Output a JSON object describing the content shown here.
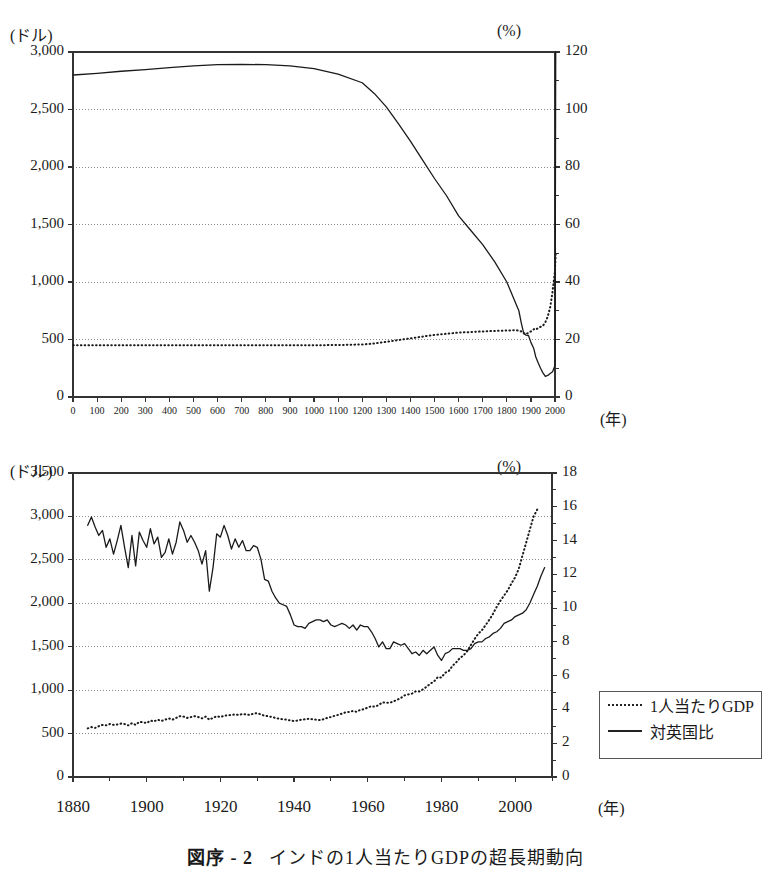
{
  "caption": {
    "number": "図序 - 2",
    "text": "インドの1人当たりGDPの超長期動向"
  },
  "legend": {
    "items": [
      {
        "label": "1人当たりGDP",
        "style": "dotted"
      },
      {
        "label": "対英国比",
        "style": "solid"
      }
    ]
  },
  "chart_data": [
    {
      "id": "top",
      "type": "line",
      "title": "",
      "xlabel": "(年)",
      "ylabel_left": "(ドル)",
      "ylabel_right": "(%)",
      "grid": true,
      "legend_position": "none",
      "xlim": [
        0,
        2000
      ],
      "xticks": [
        0,
        100,
        200,
        300,
        400,
        500,
        600,
        700,
        800,
        900,
        1000,
        1100,
        1200,
        1300,
        1400,
        1500,
        1600,
        1700,
        1800,
        1900,
        2000
      ],
      "xtick_labels": [
        "0",
        "100",
        "200",
        "300",
        "400",
        "500",
        "600",
        "700",
        "800",
        "900",
        "1000",
        "1100",
        "1200",
        "1300",
        "1400",
        "1500",
        "1600",
        "1700",
        "1800",
        "1900",
        "2000"
      ],
      "ylim_left": [
        0,
        3000
      ],
      "yticks_left": [
        0,
        500,
        1000,
        1500,
        2000,
        2500,
        3000
      ],
      "ytick_labels_left": [
        "0",
        "500",
        "1,000",
        "1,500",
        "2,000",
        "2,500",
        "3,000"
      ],
      "ylim_right": [
        0,
        120
      ],
      "yticks_right": [
        0,
        20,
        40,
        60,
        80,
        100,
        120
      ],
      "ytick_labels_right": [
        "0",
        "20",
        "40",
        "60",
        "80",
        "100",
        "120"
      ],
      "series": [
        {
          "name": "対英国比",
          "axis": "right",
          "style": "solid",
          "x": [
            1,
            100,
            200,
            300,
            400,
            500,
            600,
            700,
            800,
            900,
            1000,
            1100,
            1200,
            1250,
            1300,
            1350,
            1400,
            1450,
            1500,
            1550,
            1600,
            1650,
            1700,
            1750,
            1800,
            1820,
            1840,
            1850,
            1860,
            1870,
            1880,
            1890,
            1900,
            1910,
            1913,
            1920,
            1930,
            1940,
            1950,
            1960,
            1970,
            1980,
            1990,
            2000,
            2003
          ],
          "values": [
            112.0,
            112.6,
            113.3,
            113.9,
            114.6,
            115.2,
            115.6,
            115.7,
            115.6,
            115.2,
            114.2,
            112.3,
            109.3,
            105.6,
            100.9,
            95.1,
            89.0,
            82.5,
            76.0,
            70.0,
            63.0,
            58.0,
            53.0,
            47.0,
            40.0,
            36.0,
            32.0,
            30.0,
            25.8,
            22.2,
            21.5,
            21.4,
            19.0,
            17.2,
            16.5,
            14.0,
            11.9,
            10.0,
            8.4,
            7.2,
            7.5,
            8.2,
            8.8,
            11.0,
            120.0
          ]
        },
        {
          "name": "1人当たりGDP",
          "axis": "left",
          "style": "dotted",
          "x": [
            1,
            100,
            200,
            300,
            400,
            500,
            600,
            700,
            800,
            900,
            1000,
            1100,
            1200,
            1250,
            1300,
            1350,
            1400,
            1450,
            1500,
            1550,
            1600,
            1650,
            1700,
            1750,
            1800,
            1820,
            1840,
            1850,
            1860,
            1870,
            1880,
            1890,
            1900,
            1913,
            1920,
            1930,
            1940,
            1950,
            1960,
            1970,
            1980,
            1990,
            2000,
            2003
          ],
          "values": [
            450,
            450,
            450,
            450,
            450,
            450,
            450,
            450,
            450,
            450,
            450,
            452,
            457,
            465,
            480,
            495,
            510,
            525,
            540,
            550,
            560,
            565,
            570,
            575,
            578,
            580,
            580,
            578,
            570,
            555,
            545,
            560,
            570,
            590,
            585,
            600,
            610,
            620,
            650,
            700,
            780,
            920,
            1100,
            1250
          ]
        }
      ]
    },
    {
      "id": "bottom",
      "type": "line",
      "title": "",
      "xlabel": "(年)",
      "ylabel_left": "(ドル)",
      "ylabel_right": "(%)",
      "grid": true,
      "legend_position": "right",
      "xlim": [
        1880,
        2010
      ],
      "xticks": [
        1880,
        1900,
        1920,
        1940,
        1960,
        1980,
        2000
      ],
      "xtick_labels": [
        "1880",
        "1900",
        "1920",
        "1940",
        "1960",
        "1980",
        "2000"
      ],
      "ylim_left": [
        0,
        3500
      ],
      "yticks_left": [
        0,
        500,
        1000,
        1500,
        2000,
        2500,
        3000,
        3500
      ],
      "ytick_labels_left": [
        "0",
        "500",
        "1,000",
        "1,500",
        "2,000",
        "2,500",
        "3,000",
        "3,500"
      ],
      "ylim_right": [
        0,
        18
      ],
      "yticks_right": [
        0,
        2,
        4,
        6,
        8,
        10,
        12,
        14,
        16,
        18
      ],
      "ytick_labels_right": [
        "0",
        "2",
        "4",
        "6",
        "8",
        "10",
        "12",
        "14",
        "16",
        "18"
      ],
      "series": [
        {
          "name": "対英国比",
          "axis": "right",
          "style": "solid",
          "x": [
            1884,
            1885,
            1886,
            1887,
            1888,
            1889,
            1890,
            1891,
            1892,
            1893,
            1894,
            1895,
            1896,
            1897,
            1898,
            1899,
            1900,
            1901,
            1902,
            1903,
            1904,
            1905,
            1906,
            1907,
            1908,
            1909,
            1910,
            1911,
            1912,
            1913,
            1914,
            1915,
            1916,
            1917,
            1918,
            1919,
            1920,
            1921,
            1922,
            1923,
            1924,
            1925,
            1926,
            1927,
            1928,
            1929,
            1930,
            1931,
            1932,
            1933,
            1934,
            1935,
            1936,
            1937,
            1938,
            1939,
            1940,
            1941,
            1942,
            1943,
            1944,
            1945,
            1946,
            1947,
            1948,
            1949,
            1950,
            1951,
            1952,
            1953,
            1954,
            1955,
            1956,
            1957,
            1958,
            1959,
            1960,
            1961,
            1962,
            1963,
            1964,
            1965,
            1966,
            1967,
            1968,
            1969,
            1970,
            1971,
            1972,
            1973,
            1974,
            1975,
            1976,
            1977,
            1978,
            1979,
            1980,
            1981,
            1982,
            1983,
            1984,
            1985,
            1986,
            1987,
            1988,
            1989,
            1990,
            1991,
            1992,
            1993,
            1994,
            1995,
            1996,
            1997,
            1998,
            1999,
            2000,
            2001,
            2002,
            2003,
            2004,
            2005,
            2006,
            2007,
            2008
          ],
          "values": [
            14.9,
            15.4,
            14.8,
            14.3,
            14.6,
            13.6,
            14.1,
            13.2,
            14.0,
            14.9,
            13.6,
            12.4,
            14.3,
            12.5,
            14.5,
            14.0,
            13.6,
            14.7,
            13.8,
            14.2,
            13.0,
            13.3,
            14.1,
            13.2,
            13.9,
            15.1,
            14.6,
            13.9,
            14.3,
            13.9,
            13.4,
            12.6,
            13.4,
            11.0,
            12.4,
            14.4,
            14.2,
            14.9,
            14.3,
            13.5,
            14.1,
            13.6,
            14.0,
            13.4,
            13.4,
            13.7,
            13.6,
            12.9,
            11.7,
            11.6,
            11.0,
            10.6,
            10.3,
            10.2,
            10.1,
            9.6,
            9.0,
            8.9,
            8.9,
            8.8,
            9.1,
            9.2,
            9.3,
            9.3,
            9.2,
            9.3,
            9.0,
            8.9,
            9.0,
            9.1,
            9.0,
            8.8,
            9.0,
            8.7,
            9.0,
            8.9,
            8.9,
            8.6,
            8.2,
            7.7,
            8.0,
            7.6,
            7.6,
            8.0,
            7.9,
            7.8,
            7.9,
            7.6,
            7.3,
            7.4,
            7.2,
            7.5,
            7.3,
            7.5,
            7.7,
            7.2,
            6.9,
            7.3,
            7.4,
            7.6,
            7.6,
            7.6,
            7.5,
            7.5,
            7.6,
            7.9,
            8.0,
            8.0,
            8.2,
            8.3,
            8.5,
            8.6,
            8.8,
            9.1,
            9.2,
            9.3,
            9.5,
            9.6,
            9.7,
            9.9,
            10.3,
            10.8,
            11.3,
            11.9,
            12.4
          ]
        },
        {
          "name": "1人当たりGDP",
          "axis": "left",
          "style": "dotted",
          "x": [
            1884,
            1885,
            1886,
            1887,
            1888,
            1889,
            1890,
            1891,
            1892,
            1893,
            1894,
            1895,
            1896,
            1897,
            1898,
            1899,
            1900,
            1901,
            1902,
            1903,
            1904,
            1905,
            1906,
            1907,
            1908,
            1909,
            1910,
            1911,
            1912,
            1913,
            1914,
            1915,
            1916,
            1917,
            1918,
            1919,
            1920,
            1921,
            1922,
            1923,
            1924,
            1925,
            1926,
            1927,
            1928,
            1929,
            1930,
            1931,
            1932,
            1933,
            1934,
            1935,
            1936,
            1937,
            1938,
            1939,
            1940,
            1941,
            1942,
            1943,
            1944,
            1945,
            1946,
            1947,
            1948,
            1949,
            1950,
            1951,
            1952,
            1953,
            1954,
            1955,
            1956,
            1957,
            1958,
            1959,
            1960,
            1961,
            1962,
            1963,
            1964,
            1965,
            1966,
            1967,
            1968,
            1969,
            1970,
            1971,
            1972,
            1973,
            1974,
            1975,
            1976,
            1977,
            1978,
            1979,
            1980,
            1981,
            1982,
            1983,
            1984,
            1985,
            1986,
            1987,
            1988,
            1989,
            1990,
            1991,
            1992,
            1993,
            1994,
            1995,
            1996,
            1997,
            1998,
            1999,
            2000,
            2001,
            2002,
            2003,
            2004,
            2005,
            2006,
            2007,
            2008
          ],
          "values": [
            560,
            575,
            565,
            585,
            600,
            595,
            610,
            600,
            605,
            615,
            610,
            595,
            620,
            600,
            635,
            630,
            620,
            650,
            640,
            660,
            645,
            660,
            675,
            660,
            680,
            700,
            695,
            680,
            690,
            700,
            690,
            675,
            695,
            660,
            680,
            700,
            690,
            705,
            710,
            715,
            720,
            715,
            725,
            720,
            715,
            730,
            735,
            720,
            705,
            700,
            690,
            680,
            670,
            665,
            660,
            650,
            645,
            650,
            660,
            665,
            670,
            665,
            660,
            655,
            665,
            680,
            690,
            705,
            715,
            730,
            745,
            750,
            760,
            750,
            775,
            780,
            800,
            815,
            810,
            830,
            860,
            855,
            855,
            870,
            890,
            910,
            940,
            950,
            960,
            985,
            985,
            1010,
            1040,
            1075,
            1100,
            1150,
            1145,
            1200,
            1220,
            1280,
            1320,
            1370,
            1400,
            1450,
            1520,
            1590,
            1650,
            1690,
            1750,
            1810,
            1880,
            1960,
            2030,
            2090,
            2150,
            2230,
            2300,
            2400,
            2550,
            2700,
            2850,
            3000,
            3080
          ]
        }
      ]
    }
  ]
}
